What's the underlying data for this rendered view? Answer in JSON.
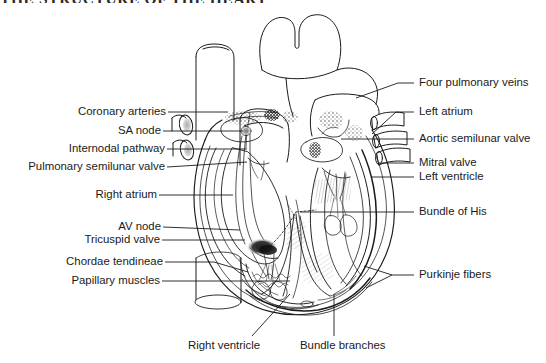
{
  "figure": {
    "title_fragment": "THE STRUCTURE OF THE HEART",
    "style": "black-and-white line drawing",
    "background_color": "#ffffff",
    "line_color": "#1a1a1a"
  },
  "labels_left": [
    {
      "id": "coronary-arteries",
      "text": "Coronary arteries",
      "x": 63,
      "y": 108,
      "leader_to_x": 228,
      "leader_to_y": 113
    },
    {
      "id": "sa-node",
      "text": "SA node",
      "x": 117,
      "y": 127,
      "leader_to_x": 243,
      "leader_to_y": 131
    },
    {
      "id": "internodal-pathway",
      "text": "Internodal pathway",
      "x": 55,
      "y": 145,
      "leader_to_x": 247,
      "leader_to_y": 148
    },
    {
      "id": "pulmonary-semilunar-valve",
      "text": "Pulmonary semilunar valve",
      "x": 13,
      "y": 164,
      "leader_to_x": 247,
      "leader_to_y": 160
    },
    {
      "id": "right-atrium",
      "text": "Right atrium",
      "x": 91,
      "y": 192,
      "leader_to_x": 233,
      "leader_to_y": 194
    },
    {
      "id": "av-node",
      "text": "AV node",
      "x": 113,
      "y": 224,
      "leader_to_x": 238,
      "leader_to_y": 226
    },
    {
      "id": "tricuspid-valve",
      "text": "Tricuspid valve",
      "x": 79,
      "y": 237,
      "leader_to_x": 243,
      "leader_to_y": 236
    },
    {
      "id": "chordae-tendineae",
      "text": "Chordae tendineae",
      "x": 58,
      "y": 259,
      "leader_to_x": 245,
      "leader_to_y": 258
    },
    {
      "id": "papillary-muscles",
      "text": "Papillary muscles",
      "x": 64,
      "y": 278,
      "leader_to_x": 290,
      "leader_to_y": 280
    }
  ],
  "labels_right": [
    {
      "id": "four-pulmonary-veins",
      "text": "Four pulmonary veins",
      "x": 419,
      "y": 80,
      "leader_to_x": 356,
      "leader_to_y": 96
    },
    {
      "id": "left-atrium",
      "text": "Left atrium",
      "x": 419,
      "y": 107,
      "leader_to_x": 386,
      "leader_to_y": 131
    },
    {
      "id": "aortic-semilunar-valve",
      "text": "Aortic semilunar valve",
      "x": 419,
      "y": 136,
      "leader_to_x": 341,
      "leader_to_y": 136
    },
    {
      "id": "mitral-valve",
      "text": "Mitral valve",
      "x": 419,
      "y": 160,
      "leader_to_x": 376,
      "leader_to_y": 160
    },
    {
      "id": "left-ventricle",
      "text": "Left ventricle",
      "x": 419,
      "y": 174,
      "leader_to_x": 371,
      "leader_to_y": 174
    },
    {
      "id": "bundle-of-his",
      "text": "Bundle of His",
      "x": 419,
      "y": 209,
      "leader_to_x": 300,
      "leader_to_y": 209
    },
    {
      "id": "purkinje-fibers",
      "text": "Purkinje fibers",
      "x": 419,
      "y": 272,
      "leader_to_x": 372,
      "leader_to_y": 275
    }
  ],
  "labels_bottom": [
    {
      "id": "right-ventricle",
      "text": "Right ventricle",
      "x": 188,
      "y": 344,
      "leader_to_x": 288,
      "leader_to_y": 293
    },
    {
      "id": "bundle-branches",
      "text": "Bundle branches",
      "x": 300,
      "y": 344,
      "leader_to_x": 334,
      "leader_to_y": 293
    }
  ],
  "anatomy_parts": [
    "superior vena cava",
    "aorta / aortic arch",
    "pulmonary trunk",
    "right pulmonary veins",
    "left pulmonary veins",
    "right atrium chamber",
    "left atrium chamber",
    "right ventricle chamber",
    "left ventricle chamber",
    "interventricular septum",
    "apex of heart",
    "inferior vena cava"
  ]
}
